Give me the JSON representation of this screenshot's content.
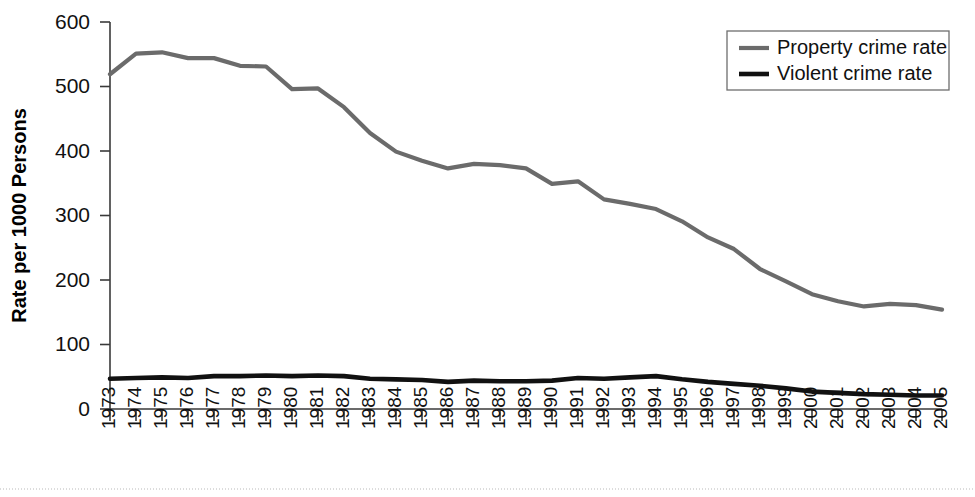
{
  "chart_data": {
    "type": "line",
    "title": "",
    "xlabel": "",
    "ylabel": "Rate per 1000 Persons",
    "ylim": [
      0,
      600
    ],
    "yticks": [
      0,
      100,
      200,
      300,
      400,
      500,
      600
    ],
    "grid": false,
    "legend_position": "top-right",
    "categories": [
      "1973",
      "1974",
      "1975",
      "1976",
      "1977",
      "1978",
      "1979",
      "1980",
      "1981",
      "1982",
      "1983",
      "1984",
      "1985",
      "1986",
      "1987",
      "1988",
      "1989",
      "1990",
      "1991",
      "1992",
      "1993",
      "1994",
      "1995",
      "1996",
      "1997",
      "1998",
      "1999",
      "2000",
      "2001",
      "2002",
      "2003",
      "2004",
      "2005"
    ],
    "series": [
      {
        "name": "Property crime rate",
        "color": "#6b6b6b",
        "values": [
          519,
          551,
          553,
          544,
          544,
          532,
          531,
          496,
          497,
          468,
          428,
          399,
          385,
          373,
          380,
          378,
          373,
          349,
          353,
          325,
          318,
          310,
          291,
          266,
          248,
          217,
          198,
          178,
          167,
          159,
          163,
          161,
          154
        ]
      },
      {
        "name": "Violent crime rate",
        "color": "#111111",
        "values": [
          47,
          48,
          49,
          48,
          51,
          51,
          52,
          51,
          52,
          51,
          47,
          46,
          45,
          42,
          44,
          43,
          43,
          44,
          48,
          47,
          49,
          51,
          46,
          42,
          39,
          36,
          32,
          27,
          25,
          23,
          22,
          21,
          21
        ]
      }
    ]
  },
  "legend": {
    "entries": [
      {
        "label": "Property crime rate",
        "color": "#6b6b6b"
      },
      {
        "label": "Violent crime rate",
        "color": "#111111"
      }
    ]
  },
  "axes": {
    "y_title": "Rate per 1000 Persons"
  }
}
